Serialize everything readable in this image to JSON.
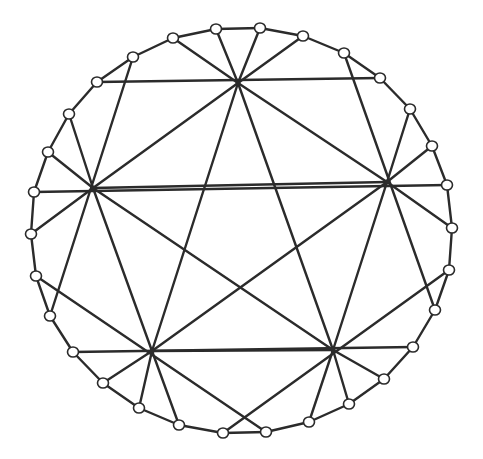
{
  "diagram": {
    "title": "",
    "colors": {
      "line": "#2b2b2b",
      "node_fill": "#ffffff",
      "background": "#ffffff"
    },
    "hubs": [
      {
        "id": "H0",
        "x": 238,
        "y": 83
      },
      {
        "id": "H1",
        "x": 93,
        "y": 188
      },
      {
        "id": "H2",
        "x": 387,
        "y": 182
      },
      {
        "id": "H3",
        "x": 152,
        "y": 351
      },
      {
        "id": "H4",
        "x": 333,
        "y": 350
      }
    ],
    "ring": [
      {
        "id": "R0",
        "x": 260,
        "y": 28
      },
      {
        "id": "R1",
        "x": 303,
        "y": 36
      },
      {
        "id": "R2",
        "x": 344,
        "y": 53
      },
      {
        "id": "R3",
        "x": 380,
        "y": 78
      },
      {
        "id": "R4",
        "x": 410,
        "y": 109
      },
      {
        "id": "R5",
        "x": 432,
        "y": 146
      },
      {
        "id": "R6",
        "x": 447,
        "y": 185
      },
      {
        "id": "R7",
        "x": 452,
        "y": 228
      },
      {
        "id": "R8",
        "x": 449,
        "y": 270
      },
      {
        "id": "R9",
        "x": 435,
        "y": 310
      },
      {
        "id": "R10",
        "x": 413,
        "y": 347
      },
      {
        "id": "R11",
        "x": 384,
        "y": 379
      },
      {
        "id": "R12",
        "x": 349,
        "y": 404
      },
      {
        "id": "R13",
        "x": 309,
        "y": 422
      },
      {
        "id": "R14",
        "x": 266,
        "y": 432
      },
      {
        "id": "R15",
        "x": 223,
        "y": 433
      },
      {
        "id": "R16",
        "x": 179,
        "y": 425
      },
      {
        "id": "R17",
        "x": 139,
        "y": 408
      },
      {
        "id": "R18",
        "x": 103,
        "y": 383
      },
      {
        "id": "R19",
        "x": 73,
        "y": 352
      },
      {
        "id": "R20",
        "x": 50,
        "y": 316
      },
      {
        "id": "R21",
        "x": 36,
        "y": 276
      },
      {
        "id": "R22",
        "x": 31,
        "y": 234
      },
      {
        "id": "R23",
        "x": 34,
        "y": 192
      },
      {
        "id": "R24",
        "x": 48,
        "y": 152
      },
      {
        "id": "R25",
        "x": 69,
        "y": 114
      },
      {
        "id": "R26",
        "x": 97,
        "y": 82
      },
      {
        "id": "R27",
        "x": 133,
        "y": 57
      },
      {
        "id": "R28",
        "x": 173,
        "y": 38
      },
      {
        "id": "R29",
        "x": 216,
        "y": 29
      }
    ],
    "edges": [
      [
        "H0",
        "H1"
      ],
      [
        "H0",
        "H2"
      ],
      [
        "H0",
        "H3"
      ],
      [
        "H0",
        "H4"
      ],
      [
        "H1",
        "H2"
      ],
      [
        "H1",
        "H3"
      ],
      [
        "H1",
        "H4"
      ],
      [
        "H2",
        "H3"
      ],
      [
        "H2",
        "H4"
      ],
      [
        "H3",
        "H4"
      ],
      [
        "R26",
        "R3"
      ],
      [
        "R23",
        "R6"
      ],
      [
        "R19",
        "R10"
      ],
      [
        "R27",
        "R20"
      ],
      [
        "R2",
        "R9"
      ],
      [
        "R21",
        "R14"
      ],
      [
        "R8",
        "R15"
      ],
      [
        "H0",
        "R28"
      ],
      [
        "H0",
        "R29"
      ],
      [
        "H0",
        "R0"
      ],
      [
        "H0",
        "R1"
      ],
      [
        "H1",
        "R25"
      ],
      [
        "H1",
        "R24"
      ],
      [
        "H1",
        "R22"
      ],
      [
        "H2",
        "R4"
      ],
      [
        "H2",
        "R5"
      ],
      [
        "H2",
        "R7"
      ],
      [
        "H3",
        "R18"
      ],
      [
        "H3",
        "R17"
      ],
      [
        "H3",
        "R16"
      ],
      [
        "H4",
        "R11"
      ],
      [
        "H4",
        "R12"
      ],
      [
        "H4",
        "R13"
      ]
    ]
  }
}
